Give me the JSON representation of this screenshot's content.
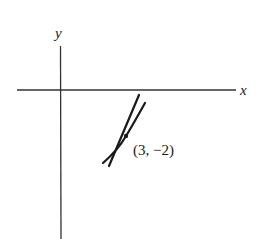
{
  "diagram": {
    "type": "tangent-line-at-point",
    "axes": {
      "x_label": "x",
      "y_label": "y"
    },
    "point": {
      "label": "(3, −2)",
      "x": 3,
      "y": -2
    },
    "elements": [
      "curve",
      "tangent-line",
      "point-marker"
    ],
    "colors": {
      "stroke": "#1a1a1a",
      "axis": "#333333",
      "background": "#ffffff"
    }
  }
}
